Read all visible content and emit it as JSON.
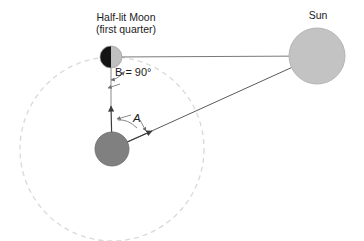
{
  "figure": {
    "kind": "astronomy-geometry-diagram",
    "background_color": "#ffffff",
    "width": 364,
    "height": 241
  },
  "labels": {
    "moon_title_line1": "Half-lit Moon",
    "moon_title_line2": "(first quarter)",
    "sun_title": "Sun",
    "angle_b": "B = 90°",
    "angle_a": "A"
  },
  "bodies": {
    "earth": {
      "name": "Earth",
      "cx": 112,
      "cy": 149,
      "r": 17,
      "fill": "#808080",
      "stroke": "#5f5f5f"
    },
    "moon": {
      "name": "Half-lit Moon (first quarter)",
      "cx": 111,
      "cy": 57,
      "r": 11,
      "dark_half_fill": "#151515",
      "lit_half_fill": "#bfbfbf",
      "stroke": "#9a9a9a"
    },
    "sun": {
      "name": "Sun",
      "cx": 317,
      "cy": 56,
      "r": 28,
      "fill": "#c3c3c3",
      "stroke": "#b2b2b2"
    }
  },
  "orbit": {
    "name": "moon-orbit-around-earth",
    "cx": 112,
    "cy": 149,
    "r": 92,
    "stroke": "#d9d9d9",
    "dash": "5 4",
    "width": 1.2
  },
  "lines": {
    "earth_to_moon": {
      "name": "earth-to-moon-sight-line",
      "x1": 112,
      "y1": 149,
      "x2": 111,
      "y2": 57,
      "stroke": "#4a4a4a",
      "arrow_at": "moon-end"
    },
    "earth_to_sun": {
      "name": "earth-to-sun-sight-line",
      "x1": 112,
      "y1": 149,
      "x2": 317,
      "y2": 56,
      "stroke": "#4a4a4a",
      "arrow_at": "near-earth"
    },
    "moon_to_sun": {
      "name": "moon-to-sun-line",
      "x1": 111,
      "y1": 57,
      "x2": 317,
      "y2": 56,
      "stroke": "#7a7a7a"
    }
  },
  "angles": {
    "at_moon": {
      "name": "right-angle-at-moon",
      "symbol": "B",
      "value_text": "B = 90°",
      "degrees": 90,
      "vertex_x": 111,
      "vertex_y": 57,
      "between": [
        "moon-to-earth",
        "moon-to-sun"
      ],
      "stroke": "#6e6e6e"
    },
    "at_earth": {
      "name": "elongation-angle-at-earth",
      "symbol": "A",
      "value_text": "A",
      "vertex_x": 112,
      "vertex_y": 149,
      "between": [
        "earth-to-moon",
        "earth-to-sun"
      ],
      "stroke": "#6e6e6e"
    }
  },
  "colors": {
    "text": "#1b1b1b",
    "line": "#4a4a4a",
    "faint_line": "#7a7a7a",
    "orbit": "#d9d9d9"
  }
}
